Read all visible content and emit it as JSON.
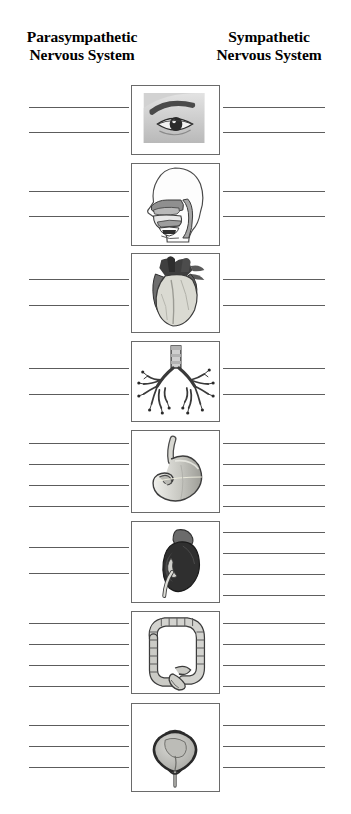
{
  "worksheet": {
    "title_left": "Parasympathetic Nervous System",
    "title_right": "Sympathetic Nervous System",
    "headers": {
      "left": {
        "line1": "Parasympathetic",
        "line2": "Nervous System"
      },
      "right": {
        "line1": "Sympathetic",
        "line2": "Nervous System"
      }
    },
    "colors": {
      "ink": "#000000",
      "rule_line": "#5c5c5c",
      "box_border": "#6a6a6a",
      "page_background": "#ffffff"
    },
    "rows": [
      {
        "id": "row-eye",
        "organ": "eye",
        "icon_name": "eye-icon",
        "top": 85,
        "box_height": 70,
        "left_lines": 2,
        "right_lines": 2,
        "left_line_offsets": [
          22,
          47
        ],
        "right_line_offsets": [
          22,
          47
        ]
      },
      {
        "id": "row-nasal-oral-cavity",
        "organ": "nasal and oral cavity",
        "icon_name": "head-profile-airway-icon",
        "top": 163,
        "box_height": 83,
        "left_lines": 2,
        "right_lines": 2,
        "left_line_offsets": [
          28,
          53
        ],
        "right_line_offsets": [
          28,
          53
        ]
      },
      {
        "id": "row-heart",
        "organ": "heart",
        "icon_name": "heart-icon",
        "top": 253,
        "box_height": 80,
        "left_lines": 2,
        "right_lines": 2,
        "left_line_offsets": [
          26,
          52
        ],
        "right_line_offsets": [
          26,
          52
        ]
      },
      {
        "id": "row-lungs",
        "organ": "lungs and bronchi",
        "icon_name": "bronchial-tree-icon",
        "top": 341,
        "box_height": 81,
        "left_lines": 2,
        "right_lines": 2,
        "left_line_offsets": [
          27,
          53
        ],
        "right_line_offsets": [
          27,
          53
        ]
      },
      {
        "id": "row-stomach",
        "organ": "stomach",
        "icon_name": "stomach-icon",
        "top": 430,
        "box_height": 83,
        "left_lines": 4,
        "right_lines": 4,
        "left_line_offsets": [
          13,
          34,
          55,
          76
        ],
        "right_line_offsets": [
          13,
          34,
          55,
          76
        ]
      },
      {
        "id": "row-kidney",
        "organ": "kidney",
        "icon_name": "kidney-icon",
        "top": 521,
        "box_height": 82,
        "left_lines": 2,
        "right_lines": 4,
        "left_line_offsets": [
          26,
          52
        ],
        "right_line_offsets": [
          11,
          32,
          53,
          74
        ]
      },
      {
        "id": "row-large-intestine",
        "organ": "large intestine",
        "icon_name": "large-intestine-icon",
        "top": 611,
        "box_height": 83,
        "left_lines": 4,
        "right_lines": 4,
        "left_line_offsets": [
          12,
          33,
          54,
          75
        ],
        "right_line_offsets": [
          12,
          33,
          54,
          75
        ]
      },
      {
        "id": "row-bladder",
        "organ": "urinary bladder",
        "icon_name": "bladder-icon",
        "top": 703,
        "box_height": 89,
        "left_lines": 3,
        "right_lines": 3,
        "left_line_offsets": [
          22,
          43,
          64
        ],
        "right_line_offsets": [
          22,
          43,
          64
        ]
      }
    ]
  }
}
